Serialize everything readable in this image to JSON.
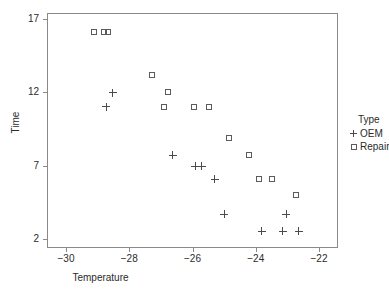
{
  "chart_data": {
    "type": "scatter",
    "title": "",
    "xlabel": "Temperature",
    "ylabel": "Time",
    "xlim": [
      -30.6,
      -21.4
    ],
    "ylim": [
      1.4,
      17.4
    ],
    "xticks": [
      -30,
      -28,
      -26,
      -24,
      -22
    ],
    "xtick_labels": [
      "−30",
      "−28",
      "−26",
      "−24",
      "−22"
    ],
    "yticks": [
      2,
      7,
      12,
      17
    ],
    "ytick_labels": [
      "2",
      "7",
      "12",
      "17"
    ],
    "grid": false,
    "legend": {
      "title": "Type",
      "position": "right",
      "entries": [
        {
          "label": "OEM",
          "marker": "plus"
        },
        {
          "label": "Repair",
          "marker": "square"
        }
      ]
    },
    "series": [
      {
        "name": "OEM",
        "marker": "plus",
        "color": "#4a4a4a",
        "points": [
          {
            "x": -28.52,
            "y": 11.96
          },
          {
            "x": -28.72,
            "y": 11.02
          },
          {
            "x": -26.62,
            "y": 7.72
          },
          {
            "x": -25.91,
            "y": 6.95
          },
          {
            "x": -25.71,
            "y": 6.95
          },
          {
            "x": -25.29,
            "y": 6.07
          },
          {
            "x": -25.0,
            "y": 3.69
          },
          {
            "x": -23.81,
            "y": 2.55
          },
          {
            "x": -23.15,
            "y": 2.55
          },
          {
            "x": -23.04,
            "y": 3.69
          },
          {
            "x": -22.64,
            "y": 2.55
          }
        ]
      },
      {
        "name": "Repair",
        "marker": "square",
        "color": "#5b5b5b",
        "points": [
          {
            "x": -29.12,
            "y": 16.14
          },
          {
            "x": -28.81,
            "y": 16.14
          },
          {
            "x": -28.67,
            "y": 16.14
          },
          {
            "x": -27.28,
            "y": 13.19
          },
          {
            "x": -26.77,
            "y": 12.05
          },
          {
            "x": -26.89,
            "y": 11.02
          },
          {
            "x": -25.95,
            "y": 11.02
          },
          {
            "x": -25.49,
            "y": 11.02
          },
          {
            "x": -24.84,
            "y": 8.86
          },
          {
            "x": -24.22,
            "y": 7.72
          },
          {
            "x": -23.91,
            "y": 6.07
          },
          {
            "x": -23.48,
            "y": 6.07
          },
          {
            "x": -22.74,
            "y": 4.99
          }
        ]
      }
    ]
  }
}
